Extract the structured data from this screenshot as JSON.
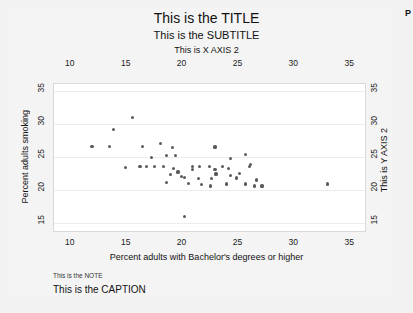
{
  "figure": {
    "title": "This is the TITLE",
    "subtitle": "This is the SUBTITLE",
    "note": "This is the NOTE",
    "caption": "This is the CAPTION",
    "edge_marker": "P",
    "background_color": "#f2f2f2",
    "plot_background_color": "#ffffff",
    "marker_color": "#5a5a5a"
  },
  "chart_data": {
    "type": "scatter",
    "title": "This is the TITLE",
    "subtitle": "This is the SUBTITLE",
    "xlabel": "Percent adults with Bachelor's degrees or higher",
    "ylabel": "Percent adults smoking",
    "xlabel_secondary": "This is X AXIS 2",
    "ylabel_secondary": "This is Y AXIS 2",
    "note": "This is the NOTE",
    "caption": "This is the CAPTION",
    "grid": true,
    "legend": "none",
    "xlim": [
      8.5,
      36.5
    ],
    "ylim": [
      13.5,
      36.0
    ],
    "x_ticks": [
      10,
      15,
      20,
      25,
      30,
      35
    ],
    "y_ticks": [
      15,
      20,
      25,
      30,
      35
    ],
    "x_ticks_top": [
      10,
      15,
      20,
      25,
      30,
      35
    ],
    "y_ticks_right": [
      15,
      20,
      25,
      30,
      35
    ],
    "points": [
      {
        "x": 15.5,
        "y": 31.0
      },
      {
        "x": 13.8,
        "y": 29.1
      },
      {
        "x": 11.9,
        "y": 26.6
      },
      {
        "x": 13.5,
        "y": 26.6
      },
      {
        "x": 16.4,
        "y": 26.6
      },
      {
        "x": 18.0,
        "y": 27.0
      },
      {
        "x": 19.1,
        "y": 26.4
      },
      {
        "x": 22.9,
        "y": 26.5
      },
      {
        "x": 17.2,
        "y": 24.9
      },
      {
        "x": 18.6,
        "y": 25.2
      },
      {
        "x": 19.4,
        "y": 25.2
      },
      {
        "x": 24.3,
        "y": 24.8
      },
      {
        "x": 25.6,
        "y": 25.4
      },
      {
        "x": 14.9,
        "y": 23.4
      },
      {
        "x": 16.2,
        "y": 23.5
      },
      {
        "x": 16.8,
        "y": 23.5
      },
      {
        "x": 17.5,
        "y": 23.5
      },
      {
        "x": 18.3,
        "y": 23.5
      },
      {
        "x": 19.2,
        "y": 23.3
      },
      {
        "x": 19.6,
        "y": 22.7
      },
      {
        "x": 20.9,
        "y": 23.6
      },
      {
        "x": 20.9,
        "y": 23.1
      },
      {
        "x": 21.5,
        "y": 23.5
      },
      {
        "x": 22.4,
        "y": 23.5
      },
      {
        "x": 22.9,
        "y": 23.1
      },
      {
        "x": 23.6,
        "y": 23.5
      },
      {
        "x": 24.1,
        "y": 23.3
      },
      {
        "x": 26.0,
        "y": 23.5
      },
      {
        "x": 26.1,
        "y": 23.9
      },
      {
        "x": 18.9,
        "y": 22.3
      },
      {
        "x": 19.9,
        "y": 22.0
      },
      {
        "x": 23.0,
        "y": 22.4
      },
      {
        "x": 24.3,
        "y": 22.2
      },
      {
        "x": 25.1,
        "y": 22.5
      },
      {
        "x": 20.2,
        "y": 21.9
      },
      {
        "x": 21.4,
        "y": 21.7
      },
      {
        "x": 22.6,
        "y": 21.7
      },
      {
        "x": 24.8,
        "y": 21.8
      },
      {
        "x": 26.6,
        "y": 21.5
      },
      {
        "x": 18.6,
        "y": 21.1
      },
      {
        "x": 20.5,
        "y": 21.0
      },
      {
        "x": 21.7,
        "y": 20.8
      },
      {
        "x": 22.5,
        "y": 20.6
      },
      {
        "x": 23.9,
        "y": 20.9
      },
      {
        "x": 25.6,
        "y": 20.9
      },
      {
        "x": 26.4,
        "y": 20.6
      },
      {
        "x": 27.1,
        "y": 20.6
      },
      {
        "x": 33.0,
        "y": 20.9
      },
      {
        "x": 20.2,
        "y": 16.0
      }
    ]
  }
}
